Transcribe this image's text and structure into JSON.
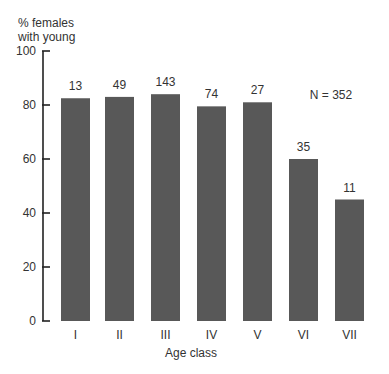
{
  "chart_data": {
    "type": "bar",
    "title": "",
    "ylabel_lines": [
      "% females",
      "with young"
    ],
    "ylabel": "% females with young",
    "xlabel": "Age class",
    "categories": [
      "I",
      "II",
      "III",
      "IV",
      "V",
      "VI",
      "VII"
    ],
    "values": [
      82.5,
      83,
      84,
      79.5,
      81,
      60,
      45
    ],
    "bar_labels": [
      "13",
      "49",
      "143",
      "74",
      "27",
      "35",
      "11"
    ],
    "ylim": [
      0,
      100
    ],
    "yticks": [
      0,
      20,
      40,
      60,
      80,
      100
    ],
    "grid": false,
    "annotation": "N = 352",
    "colors": {
      "bar": "#585858",
      "axis": "#222222",
      "text": "#333333"
    }
  }
}
